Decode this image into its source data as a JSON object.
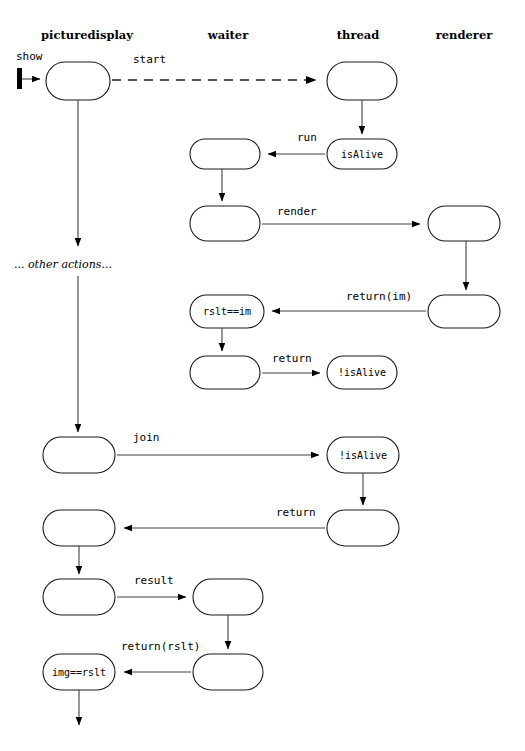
{
  "diagram": {
    "type": "uml-sequence-activity",
    "background_color": "#ffffff",
    "line_color": "#404040",
    "box_stroke_color": "#1a1a1a",
    "lanes": [
      {
        "id": "picturedisplay",
        "label": "picturedisplay",
        "x": 87
      },
      {
        "id": "waiter",
        "label": "waiter",
        "x": 228
      },
      {
        "id": "thread",
        "label": "thread",
        "x": 358
      },
      {
        "id": "renderer",
        "label": "renderer",
        "x": 464
      }
    ],
    "entry": {
      "label": "show",
      "marker": "start-bar-icon"
    },
    "nodes": [
      {
        "id": "pd1",
        "lane": "picturedisplay",
        "label": "",
        "x": 46,
        "y": 62,
        "w": 64,
        "h": 38
      },
      {
        "id": "th1",
        "lane": "thread",
        "label": "",
        "x": 327,
        "y": 62,
        "w": 70,
        "h": 38
      },
      {
        "id": "th2",
        "lane": "thread",
        "label": "isAlive",
        "x": 327,
        "y": 139,
        "w": 70,
        "h": 30
      },
      {
        "id": "wt1",
        "lane": "waiter",
        "label": "",
        "x": 190,
        "y": 139,
        "w": 70,
        "h": 30
      },
      {
        "id": "wt2",
        "lane": "waiter",
        "label": "",
        "x": 190,
        "y": 206,
        "w": 70,
        "h": 35
      },
      {
        "id": "rn1",
        "lane": "renderer",
        "label": "",
        "x": 428,
        "y": 206,
        "w": 72,
        "h": 35
      },
      {
        "id": "rn2",
        "lane": "renderer",
        "label": "",
        "x": 428,
        "y": 295,
        "w": 72,
        "h": 33
      },
      {
        "id": "wt3",
        "lane": "waiter",
        "label": "rslt==im",
        "x": 190,
        "y": 295,
        "w": 74,
        "h": 33
      },
      {
        "id": "wt4",
        "lane": "waiter",
        "label": "",
        "x": 190,
        "y": 356,
        "w": 70,
        "h": 33
      },
      {
        "id": "th3",
        "lane": "thread",
        "label": "!isAlive",
        "x": 327,
        "y": 356,
        "w": 70,
        "h": 33
      },
      {
        "id": "pd2",
        "lane": "picturedisplay",
        "label": "",
        "x": 43,
        "y": 437,
        "w": 72,
        "h": 36
      },
      {
        "id": "th4",
        "lane": "thread",
        "label": "!isAlive",
        "x": 327,
        "y": 437,
        "w": 72,
        "h": 36
      },
      {
        "id": "th5",
        "lane": "thread",
        "label": "",
        "x": 327,
        "y": 510,
        "w": 72,
        "h": 36
      },
      {
        "id": "pd3",
        "lane": "picturedisplay",
        "label": "",
        "x": 43,
        "y": 510,
        "w": 72,
        "h": 36
      },
      {
        "id": "pd4",
        "lane": "picturedisplay",
        "label": "",
        "x": 43,
        "y": 579,
        "w": 72,
        "h": 36
      },
      {
        "id": "wt5",
        "lane": "waiter",
        "label": "",
        "x": 193,
        "y": 579,
        "w": 70,
        "h": 36
      },
      {
        "id": "wt6",
        "lane": "waiter",
        "label": "",
        "x": 193,
        "y": 654,
        "w": 70,
        "h": 36
      },
      {
        "id": "pd5",
        "lane": "picturedisplay",
        "label": "img==rslt",
        "x": 43,
        "y": 654,
        "w": 72,
        "h": 36
      }
    ],
    "edge_labels": [
      {
        "id": "start",
        "text": "start",
        "x": 133,
        "y": 63,
        "style": "dashed"
      },
      {
        "id": "run",
        "text": "run",
        "x": 297,
        "y": 141,
        "style": "solid"
      },
      {
        "id": "render",
        "text": "render",
        "x": 277,
        "y": 215,
        "style": "solid"
      },
      {
        "id": "return_im",
        "text": "return(im)",
        "x": 346,
        "y": 300,
        "style": "solid"
      },
      {
        "id": "return1",
        "text": "return",
        "x": 272,
        "y": 362,
        "style": "solid"
      },
      {
        "id": "join",
        "text": "join",
        "x": 133,
        "y": 441,
        "style": "solid"
      },
      {
        "id": "return2",
        "text": "return",
        "x": 276,
        "y": 516,
        "style": "solid"
      },
      {
        "id": "result",
        "text": "result",
        "x": 134,
        "y": 584,
        "style": "solid"
      },
      {
        "id": "return_rslt",
        "text": "return(rslt)",
        "x": 121,
        "y": 650,
        "style": "solid"
      }
    ],
    "notes": [
      {
        "id": "other-actions",
        "text": "... other actions...",
        "x": 14,
        "y": 268
      }
    ]
  }
}
